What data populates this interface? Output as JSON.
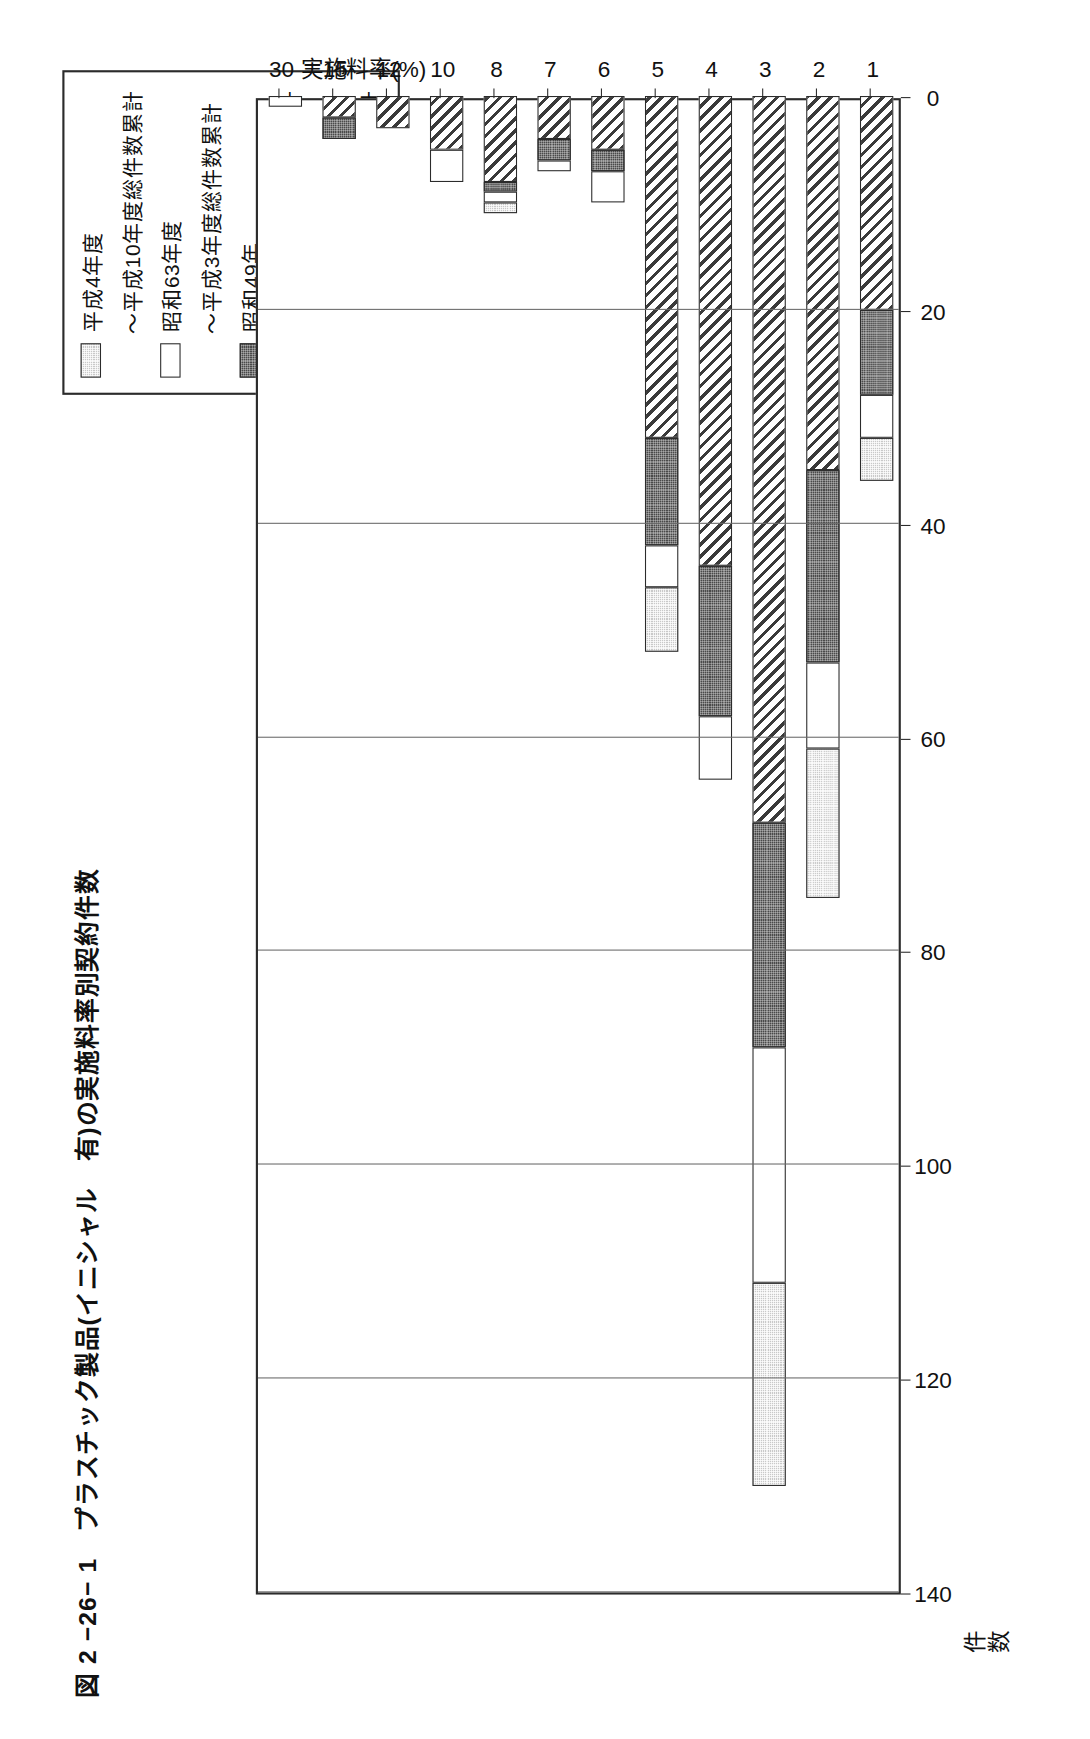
{
  "figure": {
    "number": "図 2 −26− 1",
    "title": "図 2 −26− 1　プラスチック製品(イニシャル　有)の実施料率別契約件数",
    "title_text": "プラスチック製品(イニシャル　有)の実施料率別契約件数"
  },
  "legend": {
    "position": "top-right",
    "items": [
      {
        "label": "平成4年度",
        "sublabel": "〜平成10年度総件数累計",
        "pattern": "light-gray-dotted",
        "color": "#c9c9c9"
      },
      {
        "label": "昭和63年度",
        "sublabel": "〜平成3年度総件数累計",
        "pattern": "white",
        "color": "#ffffff"
      },
      {
        "label": "昭和49年",
        "sublabel": "〜昭和52年　総件数累計",
        "pattern": "dark-gray-dotted",
        "color": "#4a4a4a"
      },
      {
        "label": "昭和43年",
        "sublabel": "〜昭和48年　総件数累計",
        "pattern": "diagonal-hatch",
        "color": "#ffffff"
      }
    ]
  },
  "axes": {
    "value_axis_title": "件数",
    "value_axis_title_lines": [
      "件",
      "数"
    ],
    "category_axis_title": "実施料率(%)",
    "value_ticks": [
      "0",
      "20",
      "40",
      "60",
      "80",
      "100",
      "120",
      "140"
    ],
    "category_ticks": [
      "1",
      "2",
      "3",
      "4",
      "5",
      "6",
      "7",
      "8",
      "10",
      "12",
      "15",
      "30"
    ]
  },
  "chart_data": {
    "type": "bar",
    "orientation": "horizontal-stacked",
    "title": "図 2 −26− 1　プラスチック製品(イニシャル　有)の実施料率別契約件数",
    "xlabel": "実施料率(%)",
    "ylabel": "件数",
    "ylim": [
      0,
      140
    ],
    "grid": true,
    "legend_position": "top-right",
    "categories": [
      "1",
      "2",
      "3",
      "4",
      "5",
      "6",
      "7",
      "8",
      "10",
      "12",
      "15",
      "30"
    ],
    "series": [
      {
        "name": "昭和43年〜昭和48年 総件数累計",
        "pattern": "diagonal-hatch",
        "values": [
          20,
          35,
          68,
          44,
          32,
          5,
          4,
          8,
          5,
          3,
          2,
          0
        ]
      },
      {
        "name": "昭和49年〜昭和52年 総件数累計",
        "pattern": "dark-gray-dotted",
        "values": [
          8,
          18,
          21,
          14,
          10,
          2,
          2,
          1,
          0,
          0,
          2,
          0
        ]
      },
      {
        "name": "昭和63年度〜平成3年度総件数累計",
        "pattern": "white",
        "values": [
          4,
          8,
          22,
          6,
          4,
          3,
          1,
          1,
          3,
          0,
          0,
          1
        ]
      },
      {
        "name": "平成4年度〜平成10年度総件数累計",
        "pattern": "light-gray-dotted",
        "values": [
          4,
          14,
          19,
          0,
          6,
          0,
          0,
          1,
          0,
          0,
          0,
          0
        ]
      }
    ],
    "totals": [
      36,
      75,
      130,
      64,
      52,
      10,
      7,
      11,
      8,
      3,
      4,
      1
    ]
  }
}
